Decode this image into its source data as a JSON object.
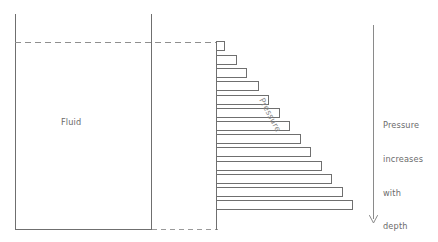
{
  "figure": {
    "type": "physics-diagram",
    "title_text_present": false,
    "background_color": "#ffffff",
    "stroke_color": "#6f6f6f",
    "text_color": "#6b6b6b"
  },
  "container": {
    "fluid_label": "Fluid",
    "left_wall": {
      "x": 15,
      "y_top": 14,
      "y_bottom": 229
    },
    "inner_wall": {
      "x": 151,
      "y_top": 14,
      "y_bottom": 229
    },
    "bottom_solid": {
      "x1": 15,
      "x2": 152,
      "y": 229
    },
    "bottom_dashed": {
      "x1": 152,
      "x2": 218,
      "y": 229
    },
    "surface_dashed": {
      "x1": 15,
      "x2": 216,
      "y": 42
    }
  },
  "pressure_axis": {
    "label": "Pressure",
    "label_rotation_deg": 62,
    "baseline_x": 216,
    "baseline_y_top": 42,
    "baseline_y_bottom": 230
  },
  "annotation": {
    "lines": [
      "Pressure",
      "increases",
      "with",
      "depth"
    ],
    "arrow": {
      "name": "depth-arrow",
      "direction": "down",
      "x": 373,
      "y_start": 25,
      "y_end": 223
    }
  },
  "chart_data": {
    "type": "bar",
    "orientation": "horizontal",
    "title": "Pressure increases with depth",
    "xlabel": "Pressure",
    "ylabel": "Depth",
    "grid": false,
    "legend": null,
    "note": "Horizontal bars drawn from the vessel wall; bar length is proportional to fluid pressure, which grows linearly with depth.",
    "categories": [
      "d1",
      "d2",
      "d3",
      "d4",
      "d5",
      "d6",
      "d7",
      "d8",
      "d9",
      "d10",
      "d11",
      "d12",
      "d13"
    ],
    "values": [
      8,
      20,
      30,
      42,
      52,
      63,
      73,
      84,
      94,
      105,
      115,
      126,
      136
    ],
    "bar_top_y": [
      41,
      55,
      68,
      81,
      95,
      108,
      121,
      134,
      147,
      161,
      174,
      187,
      200
    ],
    "bar_height": 9,
    "bar_gap": 4,
    "x_origin_px": 216,
    "xlim": [
      0,
      140
    ],
    "ylim_depth": [
      0,
      13
    ],
    "bar_fill": "#ffffff",
    "bar_stroke": "#6f6f6f"
  }
}
